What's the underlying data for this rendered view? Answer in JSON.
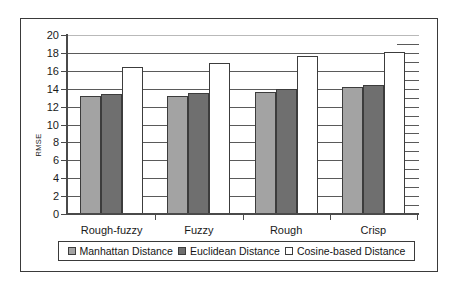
{
  "chart_data": {
    "type": "bar",
    "title": "",
    "xlabel": "",
    "ylabel": "RMSE",
    "ylim": [
      0,
      20
    ],
    "ytick_step": 2,
    "yticks": [
      0,
      2,
      4,
      6,
      8,
      10,
      12,
      14,
      16,
      18,
      20
    ],
    "grid": true,
    "legend_position": "bottom",
    "categories": [
      "Rough-fuzzy",
      "Fuzzy",
      "Rough",
      "Crisp"
    ],
    "series": [
      {
        "name": "Manhattan Distance",
        "color": "#a3a3a3",
        "values": [
          13.1,
          13.05,
          13.5,
          14.05
        ]
      },
      {
        "name": "Euclidean Distance",
        "color": "#6f6f6f",
        "values": [
          13.35,
          13.4,
          13.85,
          14.25
        ]
      },
      {
        "name": "Cosine-based Distance",
        "color": "#ffffff",
        "values": [
          16.3,
          16.8,
          17.5,
          18.0
        ]
      }
    ]
  },
  "legend": {
    "entries": [
      {
        "label": "Manhattan Distance",
        "swatch": "legend-swatch-manhattan"
      },
      {
        "label": "Euclidean Distance",
        "swatch": "legend-swatch-euclidean"
      },
      {
        "label": "Cosine-based Distance",
        "swatch": "legend-swatch-cosine"
      }
    ]
  }
}
